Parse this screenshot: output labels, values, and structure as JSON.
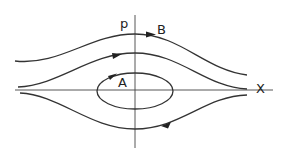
{
  "diagram": {
    "type": "phase-portrait",
    "axes": {
      "vertical_label": "p",
      "horizontal_label": "X"
    },
    "trajectories": [
      {
        "label": "B",
        "kind": "open-upper-outer",
        "direction": "rightward"
      },
      {
        "label": "",
        "kind": "open-upper-inner",
        "direction": "rightward"
      },
      {
        "label": "A",
        "kind": "closed-orbit",
        "direction": "clockwise"
      },
      {
        "label": "",
        "kind": "open-lower",
        "direction": "leftward"
      }
    ],
    "colors": {
      "line": "#333333",
      "background": "#ffffff"
    }
  }
}
